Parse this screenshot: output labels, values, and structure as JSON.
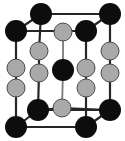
{
  "figure": {
    "width": 125,
    "height": 141,
    "background_color": "#ffffff"
  },
  "legend": {
    "black_atom_label": "black atom",
    "gray_atom_label": "gray atom",
    "bond_label": "bond"
  },
  "style": {
    "black_atom_color": "#0d0d0d",
    "gray_atom_color": "#a9a9a9",
    "gray_atom_stroke": "#4a4a4a",
    "bond_color": "#262626",
    "bond_light_color": "#7a7a7a",
    "black_atom_radius": 11,
    "gray_atom_radius": 9,
    "bond_width": 2.2,
    "bond_light_width": 1.8
  },
  "chart_data": {
    "type": "scatter",
    "xlabel": "",
    "ylabel": "",
    "xlim": [
      0,
      125
    ],
    "ylim": [
      0,
      141
    ],
    "grid": false,
    "legend_position": "none",
    "series": [
      {
        "name": "black atom",
        "color": "#0d0d0d",
        "radius": 11,
        "points": [
          {
            "id": "top-back-left",
            "x": 41,
            "y": 14
          },
          {
            "id": "top-back-right",
            "x": 110,
            "y": 14
          },
          {
            "id": "top-front-left",
            "x": 16,
            "y": 31
          },
          {
            "id": "top-front-right",
            "x": 86,
            "y": 31
          },
          {
            "id": "body-center",
            "x": 63,
            "y": 70
          },
          {
            "id": "bottom-back-left",
            "x": 38,
            "y": 110
          },
          {
            "id": "bottom-back-right",
            "x": 110,
            "y": 110
          },
          {
            "id": "bottom-front-left",
            "x": 16,
            "y": 127
          },
          {
            "id": "bottom-front-right",
            "x": 86,
            "y": 127
          }
        ]
      },
      {
        "name": "gray atom",
        "color": "#a9a9a9",
        "radius": 9,
        "points": [
          {
            "id": "top-face-center",
            "x": 63,
            "y": 32
          },
          {
            "id": "bottom-face-center",
            "x": 62,
            "y": 108
          },
          {
            "id": "front-left-upper",
            "x": 16,
            "y": 68
          },
          {
            "id": "front-left-lower",
            "x": 16,
            "y": 88
          },
          {
            "id": "back-left-upper",
            "x": 39,
            "y": 51
          },
          {
            "id": "back-left-lower",
            "x": 39,
            "y": 73
          },
          {
            "id": "front-right-upper",
            "x": 86,
            "y": 68
          },
          {
            "id": "front-right-lower",
            "x": 86,
            "y": 88
          },
          {
            "id": "back-right-upper",
            "x": 110,
            "y": 51
          },
          {
            "id": "back-right-lower",
            "x": 110,
            "y": 73
          }
        ]
      }
    ],
    "bonds": [
      {
        "from": [
          41,
          14
        ],
        "to": [
          110,
          14
        ],
        "kind": "dark"
      },
      {
        "from": [
          41,
          14
        ],
        "to": [
          16,
          31
        ],
        "kind": "dark"
      },
      {
        "from": [
          110,
          14
        ],
        "to": [
          86,
          31
        ],
        "kind": "dark"
      },
      {
        "from": [
          16,
          31
        ],
        "to": [
          86,
          31
        ],
        "kind": "dark"
      },
      {
        "from": [
          41,
          14
        ],
        "to": [
          39,
          51
        ],
        "kind": "dark"
      },
      {
        "from": [
          110,
          14
        ],
        "to": [
          110,
          51
        ],
        "kind": "dark"
      },
      {
        "from": [
          16,
          31
        ],
        "to": [
          16,
          68
        ],
        "kind": "dark"
      },
      {
        "from": [
          86,
          31
        ],
        "to": [
          86,
          68
        ],
        "kind": "dark"
      },
      {
        "from": [
          39,
          51
        ],
        "to": [
          39,
          73
        ],
        "kind": "dark"
      },
      {
        "from": [
          39,
          73
        ],
        "to": [
          38,
          110
        ],
        "kind": "dark"
      },
      {
        "from": [
          110,
          51
        ],
        "to": [
          110,
          73
        ],
        "kind": "dark"
      },
      {
        "from": [
          110,
          73
        ],
        "to": [
          110,
          110
        ],
        "kind": "dark"
      },
      {
        "from": [
          16,
          68
        ],
        "to": [
          16,
          88
        ],
        "kind": "dark"
      },
      {
        "from": [
          16,
          88
        ],
        "to": [
          16,
          127
        ],
        "kind": "dark"
      },
      {
        "from": [
          86,
          68
        ],
        "to": [
          86,
          88
        ],
        "kind": "dark"
      },
      {
        "from": [
          86,
          88
        ],
        "to": [
          86,
          127
        ],
        "kind": "dark"
      },
      {
        "from": [
          38,
          110
        ],
        "to": [
          110,
          110
        ],
        "kind": "dark"
      },
      {
        "from": [
          38,
          110
        ],
        "to": [
          16,
          127
        ],
        "kind": "dark"
      },
      {
        "from": [
          110,
          110
        ],
        "to": [
          86,
          127
        ],
        "kind": "dark"
      },
      {
        "from": [
          16,
          127
        ],
        "to": [
          86,
          127
        ],
        "kind": "dark"
      },
      {
        "from": [
          63,
          32
        ],
        "to": [
          63,
          70
        ],
        "kind": "light"
      },
      {
        "from": [
          63,
          70
        ],
        "to": [
          62,
          108
        ],
        "kind": "light"
      },
      {
        "from": [
          62,
          108
        ],
        "to": [
          38,
          110
        ],
        "kind": "dark"
      },
      {
        "from": [
          62,
          108
        ],
        "to": [
          110,
          110
        ],
        "kind": "dark"
      }
    ]
  }
}
